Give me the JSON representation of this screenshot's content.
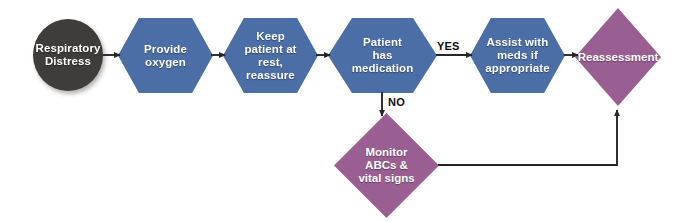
{
  "diagram": {
    "background_color": "#ffffff",
    "colors": {
      "start_node": "#3f3d3b",
      "process_node": "#4a6ea5",
      "decision_node": "#9a5f92",
      "connector": "#262626",
      "node_text": "#ffffff",
      "edge_label_text": "#0b0b0b"
    },
    "nodes": [
      {
        "id": "respiratory-distress",
        "shape": "circle",
        "label": "Respiratory\nDistress",
        "color": "#3f3d3b"
      },
      {
        "id": "provide-oxygen",
        "shape": "hexagon",
        "label": "Provide\noxygen",
        "color": "#4a6ea5"
      },
      {
        "id": "keep-patient-at-rest",
        "shape": "hexagon",
        "label": "Keep\npatient at\nrest,\nreassure",
        "color": "#4a6ea5"
      },
      {
        "id": "patient-has-medication",
        "shape": "hexagon",
        "label": "Patient\nhas\nmedication",
        "color": "#4a6ea5"
      },
      {
        "id": "assist-with-meds",
        "shape": "hexagon",
        "label": "Assist with\nmeds if\nappropriate",
        "color": "#4a6ea5"
      },
      {
        "id": "reassessment",
        "shape": "diamond",
        "label": "Reassessment",
        "color": "#9a5f92"
      },
      {
        "id": "monitor-abcs",
        "shape": "diamond",
        "label": "Monitor\nABCs &\nvital signs",
        "color": "#9a5f92"
      }
    ],
    "edge_labels": {
      "yes": "YES",
      "no": "NO"
    }
  }
}
